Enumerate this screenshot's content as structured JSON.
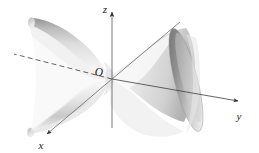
{
  "figure": {
    "background_color": "#ffffff",
    "surface_color_light": "#f7f7f7",
    "surface_color_mid": "#c9c9c9",
    "surface_color_dark": "#7a7a7a",
    "axis_color": "#3d3d3d",
    "label_color": "#1a1a1a"
  },
  "axes": {
    "origin_label": "O",
    "z": {
      "label": "z",
      "direction": "up",
      "style": "solid",
      "arrow": true
    },
    "y": {
      "label": "y",
      "direction": "right",
      "style": "solid",
      "arrow": true,
      "negative_style": "dashed"
    },
    "x": {
      "label": "x",
      "direction": "lower-left",
      "style": "solid",
      "arrow": true,
      "negative_style": "solid"
    }
  },
  "surface": {
    "name": "hyperboloid-of-one-sheet",
    "axis_of_revolution": "y",
    "lobes": [
      {
        "name": "left-lobe",
        "shading": "light"
      },
      {
        "name": "right-lobe",
        "shading": "dark-rim"
      }
    ],
    "waist_location": "origin"
  }
}
